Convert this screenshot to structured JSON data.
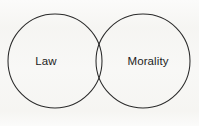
{
  "figure": {
    "kind": "venn-diagram",
    "set_count": 2,
    "background_color": "#fbfbfa",
    "stroke_color": "#2a2a2a",
    "text_color": "#1d1d1d",
    "fill": "none"
  },
  "sets": [
    {
      "id": "law",
      "label": "Law",
      "label_x": 46,
      "label_y": 62,
      "circle": {
        "cx": 55,
        "cy": 61,
        "r": 47
      }
    },
    {
      "id": "morality",
      "label": "Morality",
      "label_x": 148,
      "label_y": 62,
      "circle": {
        "cx": 143,
        "cy": 61,
        "r": 47
      }
    }
  ],
  "intersection": {
    "label": "",
    "upper_point": {
      "x": 99,
      "y": 26
    },
    "lower_point": {
      "x": 99,
      "y": 96
    }
  }
}
